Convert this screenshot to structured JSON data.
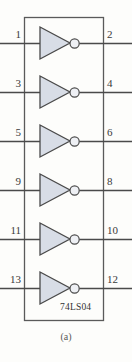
{
  "figure": {
    "caption": "(a)",
    "chip_label": "74LS04",
    "background_color": "#fdfdfb",
    "line_color": "#4a4a4a",
    "gate_fill_color": "#d8dde6",
    "gate_stroke_color": "#4a4a4a",
    "package_stroke_color": "#5a5a5a",
    "text_color": "#3a3a3a"
  },
  "package": {
    "x": 24,
    "y": 17,
    "width": 79,
    "height": 303
  },
  "gates": [
    {
      "index": 1,
      "type": "inverter",
      "input_pin": "1",
      "output_pin": "2",
      "center_y": 43
    },
    {
      "index": 2,
      "type": "inverter",
      "input_pin": "3",
      "output_pin": "4",
      "center_y": 92
    },
    {
      "index": 3,
      "type": "inverter",
      "input_pin": "5",
      "output_pin": "6",
      "center_y": 141
    },
    {
      "index": 4,
      "type": "inverter",
      "input_pin": "9",
      "output_pin": "8",
      "center_y": 190
    },
    {
      "index": 5,
      "type": "inverter",
      "input_pin": "11",
      "output_pin": "10",
      "center_y": 239
    },
    {
      "index": 6,
      "type": "inverter",
      "input_pin": "13",
      "output_pin": "12",
      "center_y": 288
    }
  ],
  "chip_label_position": {
    "x": 60,
    "y": 302
  },
  "caption_position": {
    "y": 331
  }
}
